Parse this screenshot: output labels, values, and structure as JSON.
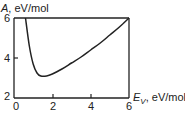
{
  "chart_data": {
    "type": "line",
    "title": "",
    "xlabel": "E_V, eV/mol",
    "ylabel": "A, eV/mol",
    "xlim": [
      0,
      6
    ],
    "ylim": [
      2,
      6
    ],
    "xticks": [
      "0",
      "2",
      "4",
      "6"
    ],
    "yticks": [
      "2",
      "4",
      "6"
    ],
    "grid": false,
    "legend": null,
    "series": [
      {
        "name": "A(E_V)",
        "x": [
          0.6,
          0.8,
          1.0,
          1.2,
          1.4,
          1.7,
          2.0,
          2.5,
          3.0,
          3.5,
          4.0,
          4.5,
          5.0,
          5.5,
          6.0
        ],
        "y": [
          6.0,
          4.6,
          3.7,
          3.25,
          3.1,
          3.1,
          3.2,
          3.45,
          3.75,
          4.05,
          4.4,
          4.75,
          5.15,
          5.55,
          6.0
        ]
      }
    ]
  },
  "labels": {
    "y_axis_name": "A",
    "y_axis_unit": ", eV/mol",
    "x_axis_name": "E",
    "x_axis_sub": "V",
    "x_axis_unit": ", eV/mol",
    "ytick_6": "6",
    "ytick_4": "4",
    "ytick_2": "2",
    "xtick_0": "0",
    "xtick_2": "2",
    "xtick_4": "4",
    "xtick_6": "6"
  }
}
